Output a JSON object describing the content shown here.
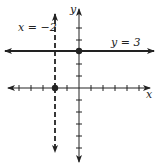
{
  "labels": {
    "vertical_line": "x = −2",
    "horizontal_line": "y = 3",
    "x_axis": "x",
    "y_axis": "y"
  },
  "colors": {
    "ink": "#222222",
    "background": "#ffffff"
  },
  "graph": {
    "origin_px": [
      79,
      88
    ],
    "unit_px": 12,
    "x_range": [
      -6,
      6
    ],
    "y_range": [
      -6,
      7
    ],
    "lines": [
      {
        "name": "y = 3",
        "type": "horizontal",
        "value": 3,
        "style": "solid"
      },
      {
        "name": "x = -2",
        "type": "vertical",
        "value": -2,
        "style": "dashed"
      }
    ],
    "points": [
      {
        "x": 0,
        "y": 3
      },
      {
        "x": -2,
        "y": 0
      }
    ]
  }
}
